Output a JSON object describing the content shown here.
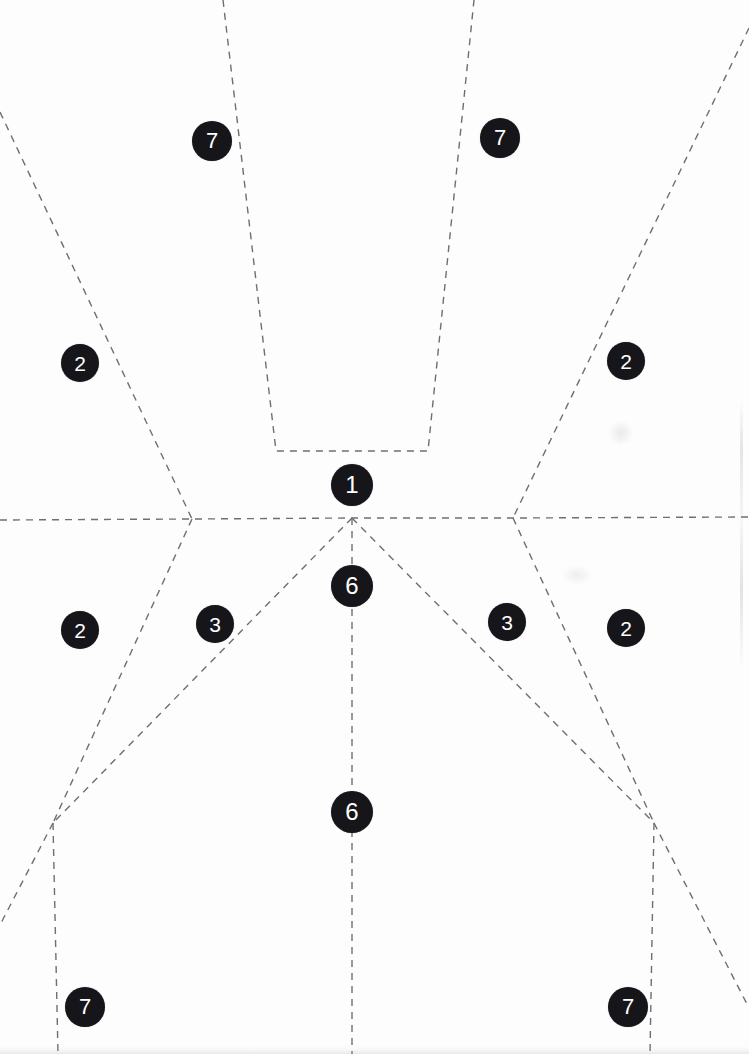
{
  "page": {
    "width": 749,
    "height": 1054,
    "background_color": "#fdfdfd"
  },
  "style": {
    "line_color": "#6e6e74",
    "line_width": 1.4,
    "dash_pattern": "7 6",
    "marker_fill": "#16161a",
    "marker_text_color": "#ffffff"
  },
  "markers": [
    {
      "id": "m-7-top-left",
      "label": "7",
      "cx": 212,
      "cy": 141,
      "r": 20
    },
    {
      "id": "m-7-top-right",
      "label": "7",
      "cx": 500,
      "cy": 138,
      "r": 20
    },
    {
      "id": "m-2-left-upper",
      "label": "2",
      "cx": 80,
      "cy": 363,
      "r": 19
    },
    {
      "id": "m-2-right-upper",
      "label": "2",
      "cx": 626,
      "cy": 361,
      "r": 19
    },
    {
      "id": "m-1-center",
      "label": "1",
      "cx": 352,
      "cy": 485,
      "r": 21
    },
    {
      "id": "m-6-center-upper",
      "label": "6",
      "cx": 352,
      "cy": 586,
      "r": 21
    },
    {
      "id": "m-2-left-lower",
      "label": "2",
      "cx": 80,
      "cy": 630,
      "r": 19
    },
    {
      "id": "m-3-left",
      "label": "3",
      "cx": 215,
      "cy": 624,
      "r": 19
    },
    {
      "id": "m-3-right",
      "label": "3",
      "cx": 507,
      "cy": 622,
      "r": 19
    },
    {
      "id": "m-2-right-lower",
      "label": "2",
      "cx": 626,
      "cy": 628,
      "r": 19
    },
    {
      "id": "m-6-center-lower",
      "label": "6",
      "cx": 352,
      "cy": 812,
      "r": 21
    },
    {
      "id": "m-7-bottom-left",
      "label": "7",
      "cx": 85,
      "cy": 1007,
      "r": 20
    },
    {
      "id": "m-7-bottom-right",
      "label": "7",
      "cx": 628,
      "cy": 1007,
      "r": 20
    }
  ],
  "nodes": {
    "center": {
      "x": 352,
      "y": 518
    },
    "left_cross": {
      "x": 192,
      "y": 519
    },
    "right_cross": {
      "x": 513,
      "y": 518
    },
    "left_fork": {
      "x": 53,
      "y": 823
    },
    "right_fork": {
      "x": 654,
      "y": 823
    }
  },
  "paths": [
    {
      "id": "horizontal-axis",
      "name": "horizontal-centre-axis",
      "d": "M 0 520 L 192 519 L 352 518 L 513 518 L 749 517"
    },
    {
      "id": "vertical-axis",
      "name": "vertical-centre-axis",
      "d": "M 352 518 L 352 1054"
    },
    {
      "id": "center-panel-trapezoid",
      "name": "centre-panel-outline",
      "d": "M 223 0 L 276 451 L 428 451 L 474 0"
    },
    {
      "id": "left-upper-diagonal",
      "name": "left-upper-seam",
      "d": "M 0 112 L 192 519"
    },
    {
      "id": "right-upper-diagonal",
      "name": "right-upper-seam",
      "d": "M 749 28 L 513 518"
    },
    {
      "id": "left-lower-diagonal",
      "name": "left-lower-seam",
      "d": "M 192 519 L 53 823"
    },
    {
      "id": "right-lower-diagonal",
      "name": "right-lower-seam",
      "d": "M 513 518 L 654 823"
    },
    {
      "id": "left-inner-diagonal",
      "name": "left-inner-seam",
      "d": "M 352 518 L 53 823"
    },
    {
      "id": "right-inner-diagonal",
      "name": "right-inner-seam",
      "d": "M 352 518 L 654 823"
    },
    {
      "id": "left-fork-vertical",
      "name": "left-fork-drop",
      "d": "M 53 823 L 58 1054"
    },
    {
      "id": "right-fork-vertical",
      "name": "right-fork-drop",
      "d": "M 654 823 L 650 1054"
    },
    {
      "id": "left-fork-outward",
      "name": "left-fork-outward-seam",
      "d": "M 53 823 L 0 925"
    },
    {
      "id": "right-fork-outward",
      "name": "right-fork-outward-seam",
      "d": "M 654 823 L 749 1008"
    }
  ]
}
